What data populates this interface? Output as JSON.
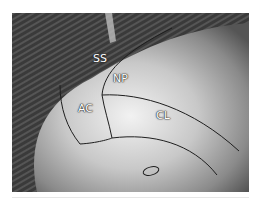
{
  "figure": {
    "labels": [
      {
        "id": "ss",
        "text": "SS"
      },
      {
        "id": "np",
        "text": "NP"
      },
      {
        "id": "ac",
        "text": "AC"
      },
      {
        "id": "cl",
        "text": "CL"
      }
    ],
    "colors": {
      "background_stripes": "#3f3f3f",
      "surface_light": "#e6e6e6",
      "surface_dark": "#6a6a6a",
      "outline": "#1e1e1e",
      "label": "#ffffff"
    }
  }
}
